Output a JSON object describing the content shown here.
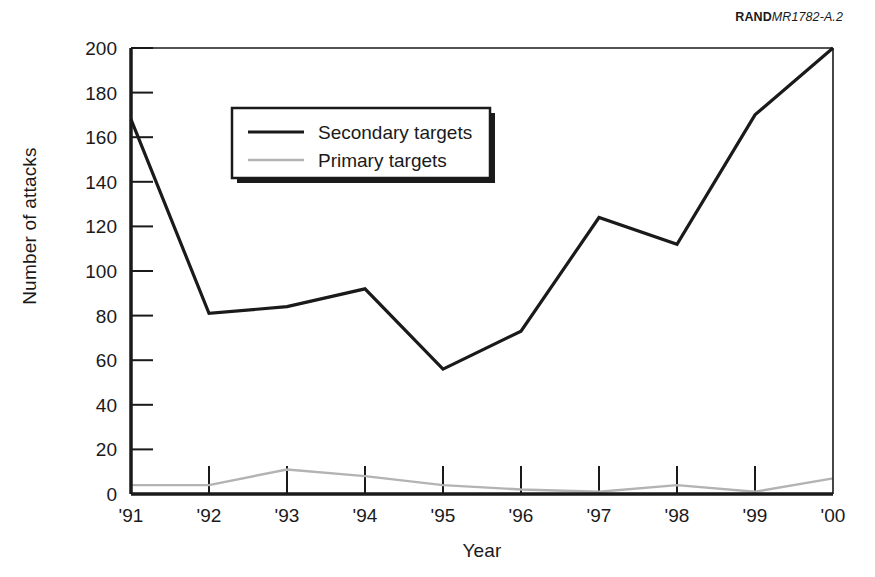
{
  "credit": {
    "brand": "RAND",
    "document": "MR1782-A.2"
  },
  "chart_data": {
    "type": "line",
    "title": "",
    "xlabel": "Year",
    "ylabel": "Number of attacks",
    "categories": [
      "'91",
      "'92",
      "'93",
      "'94",
      "'95",
      "'96",
      "'97",
      "'98",
      "'99",
      "'00"
    ],
    "xlim": [
      0,
      9
    ],
    "ylim": [
      0,
      200
    ],
    "yticks": [
      0,
      20,
      40,
      60,
      80,
      100,
      120,
      140,
      160,
      180,
      200
    ],
    "ytick_labels": [
      "0",
      "20",
      "40",
      "60",
      "80",
      "100",
      "120",
      "140",
      "160",
      "180",
      "200"
    ],
    "xtick_labels": [
      "'91",
      "'92",
      "'93",
      "'94",
      "'95",
      "'96",
      "'97",
      "'98",
      "'99",
      "'00"
    ],
    "grid": false,
    "legend_position": "upper-left-inside",
    "series": [
      {
        "name": "Secondary targets",
        "color": "#1a1a1a",
        "line_width": 3.2,
        "values": [
          168,
          81,
          84,
          92,
          56,
          73,
          124,
          112,
          170,
          200
        ]
      },
      {
        "name": "Primary targets",
        "color": "#b3b3b3",
        "line_width": 2.4,
        "values": [
          4,
          4,
          11,
          8,
          4,
          2,
          1,
          4,
          1,
          7
        ]
      }
    ]
  },
  "legend": {
    "items": [
      {
        "label": "Secondary targets",
        "color": "#1a1a1a"
      },
      {
        "label": "Primary targets",
        "color": "#b3b3b3"
      }
    ]
  }
}
